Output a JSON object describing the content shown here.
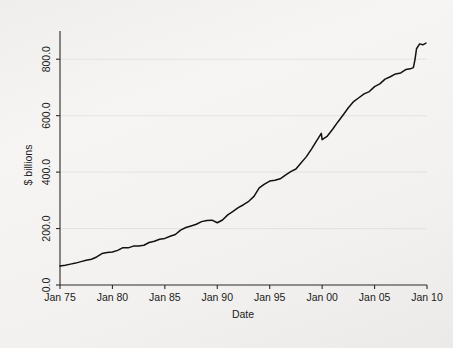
{
  "chart_data": {
    "type": "line",
    "title": "",
    "subtitle": "",
    "xlabel": "Date",
    "ylabel": "$ billions",
    "grid": true,
    "legend": false,
    "legend_position": "none",
    "xlim": [
      1975.0,
      2010.0
    ],
    "ylim": [
      0.0,
      900.0
    ],
    "xtick_labels": [
      "Jan 75",
      "Jan 80",
      "Jan 85",
      "Jan 90",
      "Jan 95",
      "Jan 00",
      "Jan 05",
      "Jan 10"
    ],
    "xtick_values": [
      1975,
      1980,
      1985,
      1990,
      1995,
      2000,
      2005,
      2010
    ],
    "ytick_labels": [
      "0.0",
      "200.0",
      "400.0",
      "600.0",
      "800.0"
    ],
    "ytick_values": [
      0,
      200,
      400,
      600,
      800
    ],
    "line_color": "#111111",
    "series": [
      {
        "name": "Currency in circulation",
        "x": [
          1975.0,
          1975.5,
          1976.0,
          1976.5,
          1977.0,
          1977.5,
          1978.0,
          1978.5,
          1979.0,
          1979.5,
          1980.0,
          1980.5,
          1981.0,
          1981.5,
          1982.0,
          1982.5,
          1983.0,
          1983.5,
          1984.0,
          1984.5,
          1985.0,
          1985.5,
          1986.0,
          1986.5,
          1987.0,
          1987.5,
          1988.0,
          1988.5,
          1989.0,
          1989.5,
          1990.0,
          1990.5,
          1991.0,
          1991.5,
          1992.0,
          1992.5,
          1993.0,
          1993.5,
          1994.0,
          1994.5,
          1995.0,
          1995.5,
          1996.0,
          1996.5,
          1997.0,
          1997.5,
          1998.0,
          1998.5,
          1999.0,
          1999.5,
          1999.92,
          2000.0,
          2000.5,
          2001.0,
          2001.5,
          2002.0,
          2002.5,
          2003.0,
          2003.5,
          2004.0,
          2004.5,
          2005.0,
          2005.5,
          2006.0,
          2006.5,
          2007.0,
          2007.5,
          2008.0,
          2008.4,
          2008.7,
          2008.85,
          2009.0,
          2009.3,
          2009.6,
          2009.9
        ],
        "y": [
          67,
          70,
          74,
          78,
          82,
          87,
          92,
          97,
          103,
          108,
          113,
          118,
          123,
          128,
          133,
          138,
          144,
          150,
          156,
          161,
          167,
          173,
          180,
          187,
          194,
          201,
          208,
          214,
          219,
          222,
          224,
          232,
          247,
          260,
          272,
          285,
          300,
          317,
          337,
          352,
          362,
          367,
          369,
          380,
          396,
          413,
          432,
          455,
          480,
          510,
          536,
          512,
          523,
          545,
          570,
          598,
          621,
          641,
          655,
          668,
          683,
          700,
          715,
          726,
          735,
          745,
          752,
          755,
          758,
          762,
          790,
          830,
          845,
          851,
          857
        ]
      }
    ],
    "annotations": [
      {
        "label": "Y2K spike and drawdown",
        "x": 2000,
        "y": 536
      },
      {
        "label": "Late-2008 surge",
        "x": 2008.9,
        "y": 830
      }
    ]
  },
  "axes": {
    "y_title": "$ billions",
    "x_title": "Date"
  }
}
